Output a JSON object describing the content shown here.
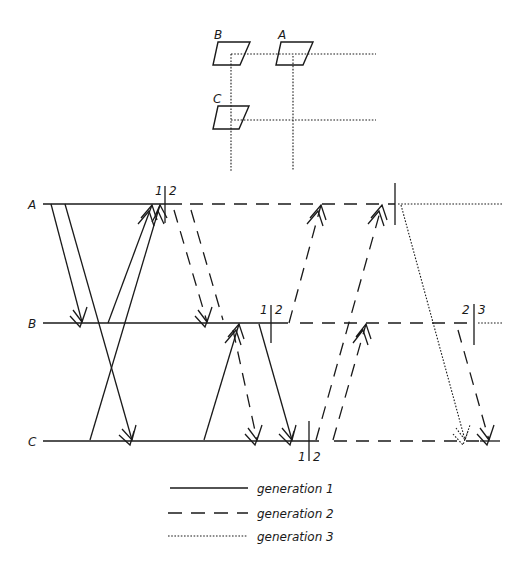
{
  "diagram": {
    "type": "timing / message-sequence diagram",
    "inset": {
      "nodes": [
        {
          "label": "B",
          "x": 226,
          "y": 45
        },
        {
          "label": "A",
          "x": 289,
          "y": 45
        },
        {
          "label": "C",
          "x": 226,
          "y": 109
        }
      ]
    },
    "lanes": [
      {
        "label": "A",
        "y": 204
      },
      {
        "label": "B",
        "y": 323
      },
      {
        "label": "C",
        "y": 441
      }
    ],
    "boundaries": [
      {
        "lane": "A",
        "x": 165,
        "left": "1",
        "right": "2"
      },
      {
        "lane": "B",
        "x": 271,
        "left": "1",
        "right": "2"
      },
      {
        "lane": "C",
        "x": 309,
        "left": "1",
        "right": "2"
      },
      {
        "lane": "A",
        "x": 395,
        "left": "",
        "right": ""
      },
      {
        "lane": "B",
        "x": 474,
        "left": "2",
        "right": "3"
      }
    ],
    "legend": [
      {
        "style": "solid",
        "label": "generation 1"
      },
      {
        "style": "dashed",
        "label": "generation 2"
      },
      {
        "style": "dotted",
        "label": "generation 3"
      }
    ]
  }
}
